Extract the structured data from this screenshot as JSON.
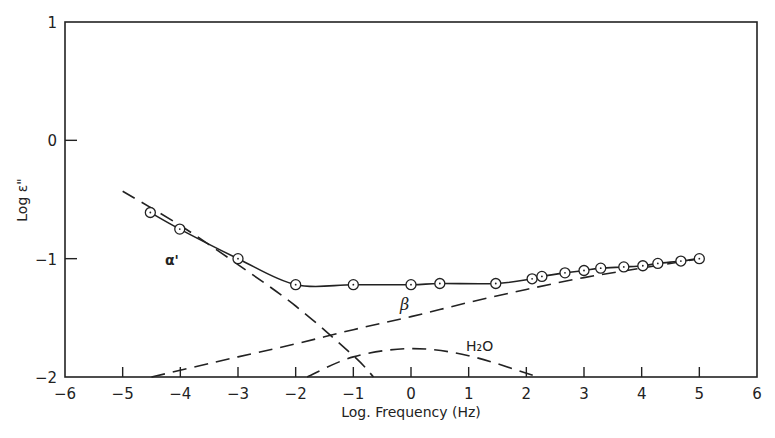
{
  "chart_data": {
    "type": "line",
    "title": "",
    "xlabel": "Log. Frequency (Hz)",
    "ylabel": "Log ε\"",
    "xlim": [
      -6,
      6
    ],
    "ylim": [
      -2,
      1
    ],
    "xticks": [
      -6,
      -5,
      -4,
      -3,
      -2,
      -1,
      0,
      1,
      2,
      3,
      4,
      5,
      6
    ],
    "yticks": [
      1,
      0,
      -1,
      -2
    ],
    "xtick_labels": [
      "-6",
      "-5",
      "-4",
      "-3",
      "-2",
      "-1",
      "0",
      "1",
      "2",
      "3",
      "4",
      "5",
      "6"
    ],
    "ytick_labels": [
      "1",
      "0",
      "-1",
      "-2"
    ],
    "grid": false,
    "legend": null,
    "series": [
      {
        "name": "measured",
        "style": "solid line with open circle markers",
        "x": [
          -4.52,
          -4.01,
          -3.0,
          -2.0,
          -1.0,
          0.0,
          0.5,
          1.47,
          2.1,
          2.27,
          2.67,
          3.0,
          3.29,
          3.69,
          4.02,
          4.28,
          4.68,
          5.0
        ],
        "y": [
          -0.61,
          -0.75,
          -1.0,
          -1.22,
          -1.22,
          -1.22,
          -1.21,
          -1.21,
          -1.17,
          -1.15,
          -1.12,
          -1.1,
          -1.08,
          -1.07,
          -1.06,
          -1.04,
          -1.02,
          -1.0
        ]
      },
      {
        "name": "α'",
        "style": "dashed",
        "x": [
          -5.0,
          -4.0,
          -3.0,
          -2.0,
          -1.0,
          -0.65
        ],
        "y": [
          -0.43,
          -0.72,
          -1.05,
          -1.4,
          -1.82,
          -2.0
        ]
      },
      {
        "name": "β",
        "style": "dashed",
        "x": [
          -4.5,
          -3.0,
          -2.0,
          -1.0,
          0.0,
          1.0,
          2.0,
          3.0,
          4.0,
          5.0
        ],
        "y": [
          -2.0,
          -1.83,
          -1.72,
          -1.6,
          -1.49,
          -1.37,
          -1.26,
          -1.16,
          -1.08,
          -1.0
        ]
      },
      {
        "name": "H2O",
        "style": "dashed",
        "x": [
          -1.8,
          -1.0,
          0.0,
          1.0,
          2.2
        ],
        "y": [
          -2.0,
          -1.83,
          -1.76,
          -1.82,
          -2.0
        ]
      }
    ],
    "annotations": [
      {
        "text": "α'",
        "x": -4.3,
        "y": -1.12
      },
      {
        "text": "β",
        "x": -0.15,
        "y": -1.42
      },
      {
        "text": "H₂O",
        "x": 0.9,
        "y": -1.72
      }
    ]
  },
  "labels": {
    "xlabel": "Log. Frequency (Hz)",
    "ylabel": "Log ε\"",
    "alpha": "α'",
    "beta": "β",
    "h2o": "H₂O"
  }
}
